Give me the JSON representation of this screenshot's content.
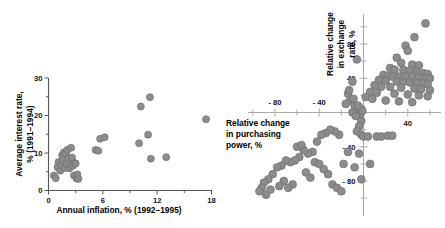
{
  "figure": {
    "background": "#ffffff",
    "marker_color": "#8c8c8c",
    "marker_edge_color": "#6f6f6f"
  },
  "chart_data": [
    {
      "type": "scatter",
      "id": "inflation-vs-interest",
      "title": "",
      "xlabel": "Annual inflation, % (1992–1995)",
      "ylabel": "Average interest rate,\n% (1991–1994)",
      "ylabel_line1": "Average interest rate,",
      "ylabel_line2": "% (1991–1994)",
      "xlim": [
        0,
        18
      ],
      "ylim": [
        0,
        30
      ],
      "xticks": [
        0,
        6,
        12,
        18
      ],
      "xticklabels": [
        "0",
        "6",
        "12",
        "18"
      ],
      "xminorticks": [
        3,
        9,
        15
      ],
      "yticks": [
        0,
        10,
        20,
        30
      ],
      "yticklabels": [
        "0",
        "10",
        "20",
        "30"
      ],
      "yminorticks": [
        5,
        15,
        25
      ],
      "grid": false,
      "legend": null,
      "points": [
        [
          0.6,
          4.0
        ],
        [
          0.8,
          3.3
        ],
        [
          1.0,
          6.2
        ],
        [
          1.1,
          7.6
        ],
        [
          1.3,
          5.3
        ],
        [
          1.4,
          6.8
        ],
        [
          1.5,
          9.4
        ],
        [
          1.6,
          8.1
        ],
        [
          1.7,
          10.2
        ],
        [
          1.8,
          6.0
        ],
        [
          1.9,
          9.8
        ],
        [
          2.0,
          7.2
        ],
        [
          2.1,
          10.9
        ],
        [
          2.2,
          8.6
        ],
        [
          2.3,
          5.9
        ],
        [
          2.4,
          7.0
        ],
        [
          2.5,
          11.4
        ],
        [
          2.6,
          8.8
        ],
        [
          2.7,
          6.6
        ],
        [
          2.8,
          4.0
        ],
        [
          2.9,
          7.3
        ],
        [
          3.0,
          7.2
        ],
        [
          3.1,
          3.2
        ],
        [
          3.2,
          4.3
        ],
        [
          3.3,
          3.1
        ],
        [
          5.2,
          10.8
        ],
        [
          5.5,
          10.6
        ],
        [
          5.7,
          13.8
        ],
        [
          6.2,
          14.2
        ],
        [
          10.0,
          12.6
        ],
        [
          10.2,
          22.4
        ],
        [
          11.0,
          14.9
        ],
        [
          11.2,
          24.9
        ],
        [
          11.3,
          8.5
        ],
        [
          13.0,
          8.9
        ],
        [
          17.4,
          19.0
        ]
      ]
    },
    {
      "type": "scatter",
      "id": "purchasing-power-vs-exchange-rate",
      "title": "",
      "xlabel": "Relative change\nin purchasing\npower, %",
      "xlabel_line1": "Relative change",
      "xlabel_line2": "in purchasing",
      "xlabel_line3": "power, %",
      "ylabel": "Relative change\nin exchange\nrate, %",
      "ylabel_line1": "Relative change",
      "ylabel_line2": "in exchange",
      "ylabel_line3": "rate, %",
      "xlim": [
        -110,
        70
      ],
      "ylim": [
        -105,
        115
      ],
      "xticks": [
        -80,
        -40,
        40
      ],
      "xticklabels": [
        "- 80",
        "- 40",
        "40"
      ],
      "xminorticks": [
        -100,
        -60,
        -20,
        20,
        60
      ],
      "yticks": [
        80,
        40,
        -40,
        -80
      ],
      "yticklabels": [
        "80",
        "40",
        "- 40",
        "- 80"
      ],
      "yminorticks": [
        100,
        60,
        20,
        -20,
        -60,
        -100
      ],
      "grid": false,
      "legend": null,
      "axes_cross_at_origin": true,
      "points": [
        [
          56,
          104
        ],
        [
          46,
          88
        ],
        [
          38,
          78
        ],
        [
          40,
          72
        ],
        [
          30,
          64
        ],
        [
          34,
          58
        ],
        [
          44,
          56
        ],
        [
          50,
          55
        ],
        [
          24,
          52
        ],
        [
          28,
          50
        ],
        [
          36,
          50
        ],
        [
          42,
          49
        ],
        [
          48,
          48
        ],
        [
          54,
          46
        ],
        [
          58,
          45
        ],
        [
          18,
          44
        ],
        [
          22,
          43
        ],
        [
          26,
          42
        ],
        [
          32,
          42
        ],
        [
          38,
          42
        ],
        [
          44,
          42
        ],
        [
          50,
          41
        ],
        [
          56,
          40
        ],
        [
          60,
          40
        ],
        [
          14,
          38
        ],
        [
          20,
          37
        ],
        [
          30,
          36
        ],
        [
          36,
          36
        ],
        [
          42,
          35
        ],
        [
          48,
          35
        ],
        [
          54,
          34
        ],
        [
          58,
          33
        ],
        [
          10,
          32
        ],
        [
          16,
          30
        ],
        [
          24,
          30
        ],
        [
          34,
          29
        ],
        [
          46,
          28
        ],
        [
          52,
          27
        ],
        [
          60,
          26
        ],
        [
          6,
          24
        ],
        [
          12,
          23
        ],
        [
          28,
          22
        ],
        [
          40,
          21
        ],
        [
          50,
          20
        ],
        [
          58,
          19
        ],
        [
          2,
          18
        ],
        [
          8,
          16
        ],
        [
          20,
          14
        ],
        [
          32,
          13
        ],
        [
          44,
          12
        ],
        [
          -6,
          62
        ],
        [
          -10,
          36
        ],
        [
          -14,
          22
        ],
        [
          -12,
          14
        ],
        [
          -16,
          10
        ],
        [
          -8,
          8
        ],
        [
          -4,
          6
        ],
        [
          -2,
          4
        ],
        [
          -6,
          2
        ],
        [
          -10,
          0
        ],
        [
          -3,
          -2
        ],
        [
          -7,
          -4
        ],
        [
          -1,
          2
        ],
        [
          -5,
          8
        ],
        [
          -9,
          16
        ],
        [
          -13,
          26
        ],
        [
          -2,
          -10
        ],
        [
          -4,
          -16
        ],
        [
          -6,
          -22
        ],
        [
          -2,
          -26
        ],
        [
          0,
          -28
        ],
        [
          4,
          -28
        ],
        [
          12,
          -28
        ],
        [
          16,
          -28
        ],
        [
          22,
          -27
        ],
        [
          26,
          -27
        ],
        [
          -4,
          -48
        ],
        [
          -8,
          -64
        ],
        [
          6,
          -60
        ],
        [
          -2,
          -78
        ],
        [
          -22,
          -26
        ],
        [
          -26,
          -22
        ],
        [
          -30,
          -20
        ],
        [
          -34,
          -24
        ],
        [
          -38,
          -26
        ],
        [
          -42,
          -34
        ],
        [
          -46,
          -46
        ],
        [
          -50,
          -48
        ],
        [
          -54,
          -44
        ],
        [
          -58,
          -52
        ],
        [
          -62,
          -56
        ],
        [
          -66,
          -58
        ],
        [
          -70,
          -56
        ],
        [
          -74,
          -62
        ],
        [
          -78,
          -64
        ],
        [
          -82,
          -72
        ],
        [
          -86,
          -78
        ],
        [
          -90,
          -82
        ],
        [
          -92,
          -88
        ],
        [
          -94,
          -92
        ],
        [
          -88,
          -96
        ],
        [
          -84,
          -90
        ],
        [
          -60,
          -40
        ],
        [
          -56,
          -38
        ],
        [
          -44,
          -58
        ],
        [
          -40,
          -60
        ],
        [
          -36,
          -66
        ],
        [
          -32,
          -72
        ],
        [
          -28,
          -84
        ],
        [
          -24,
          -88
        ],
        [
          -20,
          -92
        ],
        [
          -48,
          -76
        ],
        [
          -52,
          -70
        ],
        [
          -64,
          -84
        ],
        [
          -68,
          -88
        ],
        [
          -72,
          -80
        ],
        [
          -76,
          -86
        ],
        [
          -18,
          -60
        ],
        [
          -14,
          -46
        ]
      ]
    }
  ]
}
